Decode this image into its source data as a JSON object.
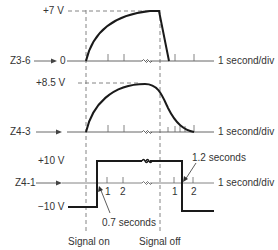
{
  "traces": [
    {
      "id": "Z3-6",
      "name": "Z3-6",
      "peak_label": "+7 V",
      "baseline_label": "0",
      "timescale": "1 second/div"
    },
    {
      "id": "Z4-3",
      "name": "Z4-3",
      "peak_label": "+8.5 V",
      "timescale": "1 second/div"
    },
    {
      "id": "Z4-1",
      "name": "Z4-1",
      "high_label": "+10 V",
      "low_label": "−10 V",
      "timescale": "1 second/div",
      "tick_labels_on": [
        "1",
        "2"
      ],
      "tick_labels_off": [
        "1",
        "2"
      ],
      "delay_on": "0.7 seconds",
      "delay_off": "1.2 seconds"
    }
  ],
  "markers": {
    "signal_on": "Signal on",
    "signal_off": "Signal off"
  },
  "colors": {
    "trace": "#1a1a1a",
    "axis": "#555555",
    "dashed": "#777777"
  }
}
